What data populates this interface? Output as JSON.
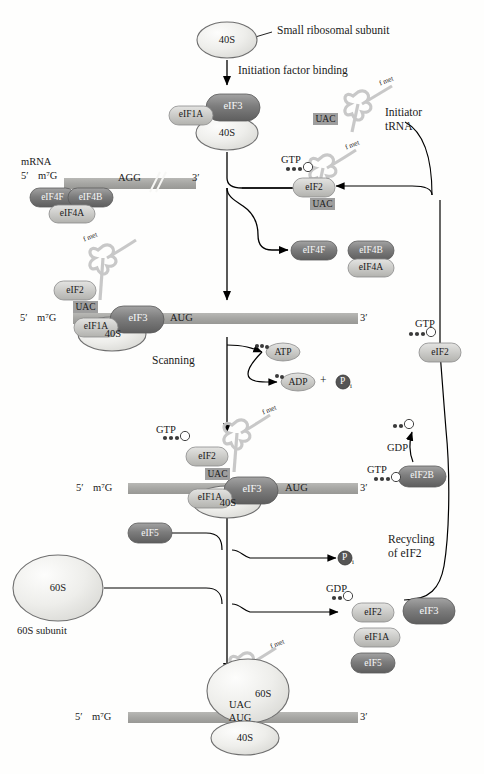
{
  "figure": {
    "type": "biology-pathway-diagram"
  },
  "labels": {
    "small_ribosomal_subunit": "Small ribosomal subunit",
    "initiation_factor_binding": "Initiation factor binding",
    "initiator_trna_line1": "Initiator",
    "initiator_trna_line2": "tRNA",
    "mrna": "mRNA",
    "scanning": "Scanning",
    "recycling_line1": "Recycling",
    "recycling_line2": "of eIF2",
    "sixtys_subunit": "60S subunit",
    "plus_sign": "+"
  },
  "subunits": {
    "fortys": "40S",
    "sixtys": "60S"
  },
  "factors": {
    "eif3": "eIF3",
    "eif1a": "eIF1A",
    "eif2": "eIF2",
    "eif2b": "eIF2B",
    "eif4f": "eIF4F",
    "eif4b": "eIF4B",
    "eif4a": "eIF4A",
    "eif5": "eIF5"
  },
  "nucleotides": {
    "gtp": "GTP",
    "gdp": "GDP",
    "atp": "ATP",
    "adp": "ADP",
    "pi": "P",
    "pi_sub": "i"
  },
  "mrna_marks": {
    "five_prime": "5′",
    "cap": "m⁷G",
    "three_prime": "3′",
    "start_codon": "AUG",
    "start_codon_top": "AGG",
    "anticodon": "UAC",
    "trna_aa": "f met"
  },
  "colors": {
    "mrna_bar": "#a9a9a9",
    "ribosome_fill": "#ededea",
    "ribosome_stroke": "#6f6f6f",
    "dark_factor": "#7a7a7a",
    "light_factor": "#c9c9c9",
    "trna_gray": "#c6c6c6",
    "arrow": "#000000",
    "phosphate": "#555555"
  }
}
